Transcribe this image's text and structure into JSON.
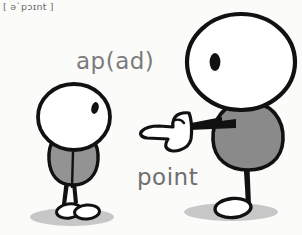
{
  "illustration": {
    "title": "point",
    "phonetic": "[ ə`pɔɪnt ]",
    "gloss": "ap(ad)",
    "label": "point",
    "background_color": "#fbfbfa",
    "ink_color": "#111111",
    "body_fill": "#8e8e8e",
    "head_fill": "#ffffff",
    "shadow_color": "#b9b9b9",
    "text_color": "#757575"
  },
  "figures": [
    {
      "name": "small-figure",
      "role": "person being pointed at",
      "side": "left",
      "head_fill": "#ffffff",
      "body_fill": "#939393",
      "eye": "single dark oval, right side of head"
    },
    {
      "name": "large-figure",
      "role": "person pointing",
      "side": "right",
      "head_fill": "#ffffff",
      "body_fill": "#8a8a8a",
      "eye": "single dark oval, left side of head",
      "gesture": "pointing-hand"
    }
  ],
  "icons": {
    "pointing_hand": "pointing-hand-icon",
    "shadow": "ground-shadow-icon"
  }
}
